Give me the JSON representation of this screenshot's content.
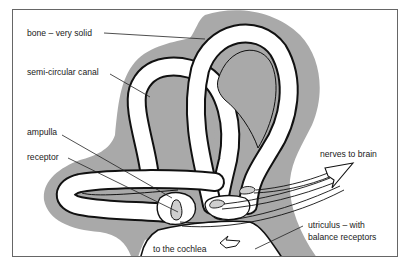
{
  "diagram": {
    "labels": {
      "bone": "bone – very solid",
      "canal": "semi-circular canal",
      "ampulla": "ampulla",
      "receptor": "receptor",
      "nerves": "nerves to brain",
      "utriculus_line1": "utriculus – with",
      "utriculus_line2": "balance receptors",
      "cochlea": "to the cochlea"
    },
    "colors": {
      "background": "#ffffff",
      "frame": "#555555",
      "bone": "#a9a9a9",
      "outline": "#111111",
      "canal_fill": "#ffffff"
    }
  }
}
